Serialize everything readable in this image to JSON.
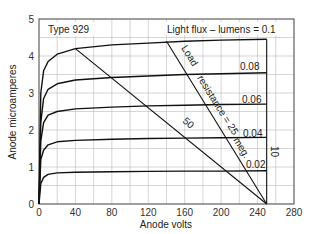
{
  "chart_data": {
    "type": "line",
    "title": "Type 929",
    "xlabel": "Anode volts",
    "ylabel": "Anode microamperes",
    "xlim": [
      0,
      280
    ],
    "ylim": [
      0,
      5
    ],
    "x_ticks": [
      0,
      40,
      80,
      120,
      160,
      200,
      240,
      280
    ],
    "y_ticks": [
      0,
      1,
      2,
      3,
      4,
      5
    ],
    "grid": true,
    "grid_x_step": 20,
    "grid_y_step": 0.5,
    "legend_title": "Light flux – lumens = 0.1",
    "series": [
      {
        "name": "0.1",
        "label": "Light flux – lumens = 0.1",
        "x": [
          0,
          2,
          5,
          10,
          20,
          40,
          80,
          120,
          160,
          200,
          250
        ],
        "values": [
          0,
          3.0,
          3.6,
          3.85,
          4.05,
          4.2,
          4.3,
          4.35,
          4.4,
          4.43,
          4.45
        ]
      },
      {
        "name": "0.08",
        "label": "0.08",
        "x": [
          0,
          2,
          5,
          10,
          20,
          40,
          80,
          120,
          160,
          200,
          250
        ],
        "values": [
          0,
          2.2,
          2.85,
          3.1,
          3.25,
          3.35,
          3.42,
          3.46,
          3.5,
          3.52,
          3.55
        ]
      },
      {
        "name": "0.06",
        "label": "0.06",
        "x": [
          0,
          2,
          5,
          10,
          20,
          40,
          80,
          120,
          160,
          200,
          250
        ],
        "values": [
          0,
          1.7,
          2.2,
          2.4,
          2.5,
          2.57,
          2.62,
          2.65,
          2.67,
          2.69,
          2.7
        ]
      },
      {
        "name": "0.04",
        "label": "0.04",
        "x": [
          0,
          2,
          5,
          10,
          20,
          40,
          80,
          120,
          160,
          200,
          250
        ],
        "values": [
          0,
          1.2,
          1.45,
          1.6,
          1.68,
          1.72,
          1.75,
          1.77,
          1.78,
          1.79,
          1.8
        ]
      },
      {
        "name": "0.02",
        "label": "0.02",
        "x": [
          0,
          2,
          5,
          10,
          20,
          40,
          80,
          120,
          160,
          200,
          250
        ],
        "values": [
          0,
          0.55,
          0.72,
          0.8,
          0.84,
          0.86,
          0.87,
          0.88,
          0.89,
          0.89,
          0.9
        ]
      }
    ],
    "load_lines": [
      {
        "name": "50",
        "label": "50",
        "x": [
          40,
          250
        ],
        "values": [
          4.2,
          0
        ]
      },
      {
        "name": "25",
        "label": "Load resistance = 25 meg.",
        "x": [
          140,
          250
        ],
        "values": [
          4.4,
          0
        ]
      },
      {
        "name": "10",
        "label": "10",
        "x": [
          250,
          250
        ],
        "values": [
          4.45,
          0
        ]
      }
    ]
  },
  "labels": {
    "title": "Type 929",
    "xlabel": "Anode volts",
    "ylabel": "Anode microamperes",
    "flux_header": "Light flux – lumens = 0.1",
    "flux_008": "0.08",
    "flux_006": "0.06",
    "flux_004": "0.04",
    "flux_002": "0.02",
    "load_word": "Load",
    "resistance_25": "resistance = 25",
    "meg": "meg.",
    "load_50": "50",
    "load_10": "10",
    "x_ticks": [
      "0",
      "40",
      "80",
      "120",
      "160",
      "200",
      "240",
      "280"
    ],
    "y_ticks": [
      "0",
      "1",
      "2",
      "3",
      "4",
      "5"
    ]
  }
}
